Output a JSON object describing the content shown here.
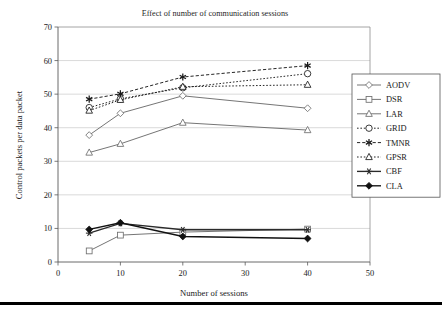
{
  "chart_data": {
    "type": "line",
    "title": "Effect of number of communication sessions",
    "xlabel": "Number of sessions",
    "ylabel": "Control packets per data packet",
    "x": [
      5,
      10,
      20,
      40
    ],
    "xlim": [
      0,
      50
    ],
    "ylim": [
      0,
      70
    ],
    "xticks": [
      0,
      10,
      20,
      30,
      40,
      50
    ],
    "yticks": [
      0,
      10,
      20,
      30,
      40,
      50,
      60,
      70
    ],
    "grid": "horizontal",
    "legend_position": "right",
    "series": [
      {
        "name": "AODV",
        "values": [
          37.8,
          44.3,
          49.5,
          45.8
        ],
        "marker": "diamond-open",
        "dash": "solid",
        "color": "#6e6e6e"
      },
      {
        "name": "DSR",
        "values": [
          3.3,
          8.0,
          8.9,
          9.8
        ],
        "marker": "square-open",
        "dash": "solid",
        "color": "#6e6e6e"
      },
      {
        "name": "LAR",
        "values": [
          32.6,
          35.2,
          41.5,
          39.3
        ],
        "marker": "triangle-open",
        "dash": "solid",
        "color": "#6e6e6e"
      },
      {
        "name": "GRID",
        "values": [
          46.0,
          48.6,
          51.9,
          56.1
        ],
        "marker": "circle-open",
        "dash": "dotted",
        "color": "#1a1a1a"
      },
      {
        "name": "TMNR",
        "values": [
          48.5,
          50.1,
          55.1,
          58.5
        ],
        "marker": "star",
        "dash": "dashed",
        "color": "#1a1a1a"
      },
      {
        "name": "GPSR",
        "values": [
          45.1,
          48.3,
          52.2,
          52.8
        ],
        "marker": "triangle-open",
        "dash": "dotted",
        "color": "#1a1a1a"
      },
      {
        "name": "CBF",
        "values": [
          8.6,
          11.5,
          9.6,
          9.6
        ],
        "marker": "cross-star",
        "dash": "solid",
        "color": "#2a2a2a"
      },
      {
        "name": "CLA",
        "values": [
          9.7,
          11.7,
          7.6,
          7.0
        ],
        "marker": "diamond-filled",
        "dash": "solid",
        "color": "#111111"
      }
    ]
  },
  "legend": {
    "entries": [
      "AODV",
      "DSR",
      "LAR",
      "GRID",
      "TMNR",
      "GPSR",
      "CBF",
      "CLA"
    ]
  }
}
